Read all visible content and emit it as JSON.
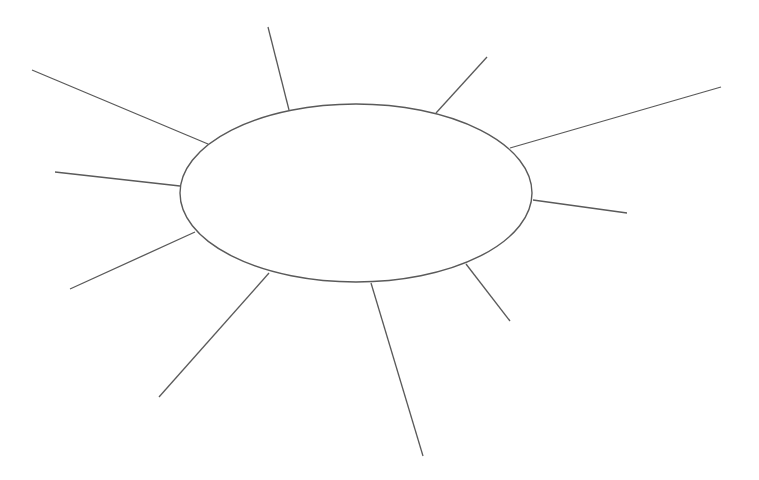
{
  "diagram": {
    "type": "spider-map",
    "background": "#ffffff",
    "stroke_color": "#5a5a5a",
    "center_ellipse": {
      "cx": 356,
      "cy": 193,
      "rx": 176,
      "ry": 89,
      "label": ""
    },
    "branches": [
      {
        "x1": 208,
        "y1": 144,
        "x2": 32,
        "y2": 70,
        "label": ""
      },
      {
        "x1": 289,
        "y1": 110,
        "x2": 268,
        "y2": 27,
        "label": ""
      },
      {
        "x1": 436,
        "y1": 113,
        "x2": 487,
        "y2": 57,
        "label": ""
      },
      {
        "x1": 510,
        "y1": 148,
        "x2": 721,
        "y2": 87,
        "label": ""
      },
      {
        "x1": 180,
        "y1": 186,
        "x2": 55,
        "y2": 172,
        "label": ""
      },
      {
        "x1": 533,
        "y1": 200,
        "x2": 627,
        "y2": 213,
        "label": ""
      },
      {
        "x1": 195,
        "y1": 232,
        "x2": 70,
        "y2": 289,
        "label": ""
      },
      {
        "x1": 269,
        "y1": 273,
        "x2": 159,
        "y2": 397,
        "label": ""
      },
      {
        "x1": 371,
        "y1": 283,
        "x2": 423,
        "y2": 456,
        "label": ""
      },
      {
        "x1": 466,
        "y1": 264,
        "x2": 510,
        "y2": 321,
        "label": ""
      }
    ]
  }
}
